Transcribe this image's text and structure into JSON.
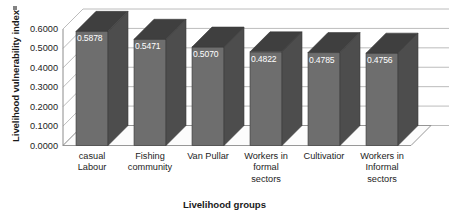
{
  "chart_data": {
    "type": "bar",
    "title": "",
    "subtitle": "",
    "xlabel": "Livelihood groups",
    "ylabel": "Livelihood vulnerability index",
    "categories": [
      "casual Labour",
      "Fishing community",
      "Van Pullar",
      "Workers in formal sectors",
      "Cultivatior",
      "Workers in Informal sectors"
    ],
    "category_lines": [
      [
        "casual",
        "Labour"
      ],
      [
        "Fishing",
        "community"
      ],
      [
        "Van Pullar"
      ],
      [
        "Workers in",
        "formal",
        "sectors"
      ],
      [
        "Cultivatior"
      ],
      [
        "Workers in",
        "Informal",
        "sectors"
      ]
    ],
    "values": [
      0.5878,
      0.5471,
      0.507,
      0.4822,
      0.4785,
      0.4756
    ],
    "value_labels": [
      "0.5878",
      "0.5471",
      "0.5070",
      "0.4822",
      "0.4785",
      "0.4756"
    ],
    "ylim": [
      0.0,
      0.6
    ],
    "ytick_labels": [
      "0.0000",
      "0.1000",
      "0.2000",
      "0.3000",
      "0.4000",
      "0.5000",
      "0.6000"
    ],
    "ytick_values": [
      0.0,
      0.1,
      0.2,
      0.3,
      0.4,
      0.5,
      0.6
    ],
    "grid": true,
    "legend": false,
    "legend_position": "none",
    "style": "3d-column",
    "colors": {
      "bar_front": "#6e6e6e",
      "bar_side": "#4d4d4d",
      "bar_top": "#3f3f3f",
      "grid_line": "#b4b4b4",
      "axis_line": "#8c8c8c",
      "floor": "#fcfcfc",
      "data_label": "#ffffff",
      "text": "#1d1d1d",
      "background": "#ffffff"
    }
  }
}
